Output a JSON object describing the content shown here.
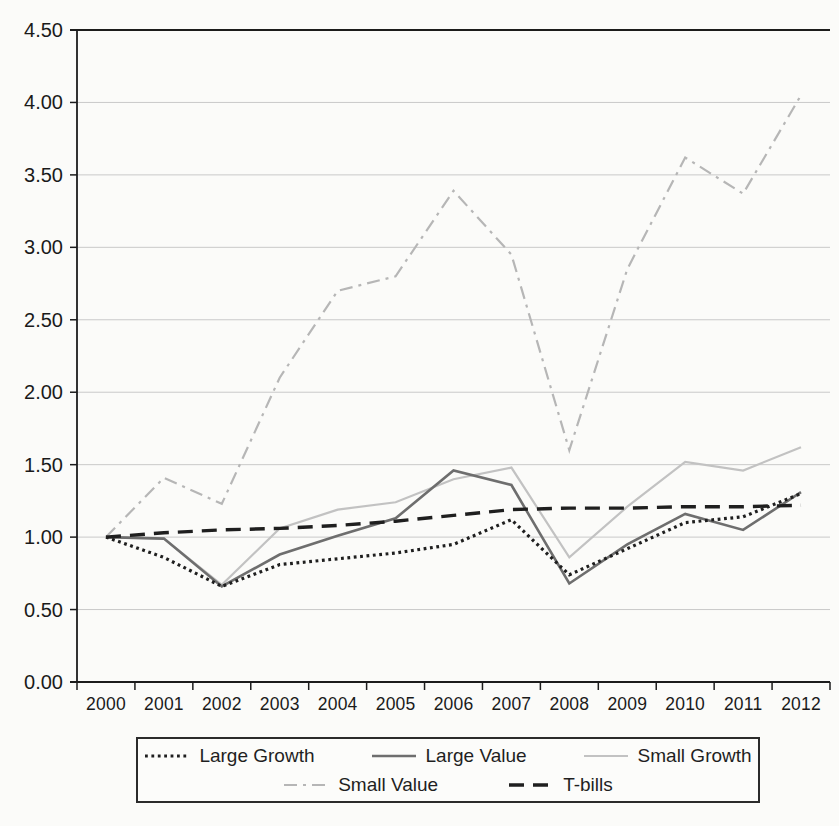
{
  "chart_data": {
    "type": "line",
    "title": "",
    "xlabel": "",
    "ylabel": "",
    "x": [
      "2000",
      "2001",
      "2002",
      "2003",
      "2004",
      "2005",
      "2006",
      "2007",
      "2008",
      "2009",
      "2010",
      "2011",
      "2012"
    ],
    "ylim": [
      0.0,
      4.5
    ],
    "ytick_step": 0.5,
    "ytick_labels": [
      "0.00",
      "0.50",
      "1.00",
      "1.50",
      "2.00",
      "2.50",
      "3.00",
      "3.50",
      "4.00",
      "4.50"
    ],
    "grid": "horizontal",
    "gridline_color": "#c9c9c9",
    "axis_color": "#1c1c1c",
    "series": [
      {
        "name": "Small Growth",
        "style": "solid-light",
        "color": "#c2c2c2",
        "values": [
          1.0,
          0.99,
          0.67,
          1.06,
          1.19,
          1.24,
          1.4,
          1.48,
          0.86,
          1.21,
          1.52,
          1.46,
          1.62
        ]
      },
      {
        "name": "Small Value",
        "style": "dashdot-light",
        "color": "#b6b6b6",
        "values": [
          1.0,
          1.41,
          1.23,
          2.1,
          2.7,
          2.8,
          3.39,
          2.95,
          1.6,
          2.85,
          3.62,
          3.37,
          4.05
        ]
      },
      {
        "name": "Large Value",
        "style": "solid-dark",
        "color": "#6e6e6e",
        "values": [
          1.0,
          0.99,
          0.66,
          0.88,
          1.01,
          1.13,
          1.46,
          1.36,
          0.68,
          0.95,
          1.16,
          1.05,
          1.31
        ]
      },
      {
        "name": "T-bills",
        "style": "dashed-black",
        "color": "#1f1f1f",
        "values": [
          1.0,
          1.03,
          1.05,
          1.06,
          1.08,
          1.11,
          1.15,
          1.19,
          1.2,
          1.2,
          1.21,
          1.21,
          1.22
        ]
      },
      {
        "name": "Large Growth",
        "style": "dotted-black",
        "color": "#1f1f1f",
        "values": [
          1.0,
          0.86,
          0.66,
          0.81,
          0.85,
          0.89,
          0.95,
          1.12,
          0.74,
          0.92,
          1.1,
          1.14,
          1.3
        ]
      }
    ],
    "legend": {
      "position": "bottom",
      "rows": [
        [
          "Large Growth",
          "Large Value",
          "Small Growth"
        ],
        [
          "Small Value",
          "T-bills"
        ]
      ]
    }
  }
}
